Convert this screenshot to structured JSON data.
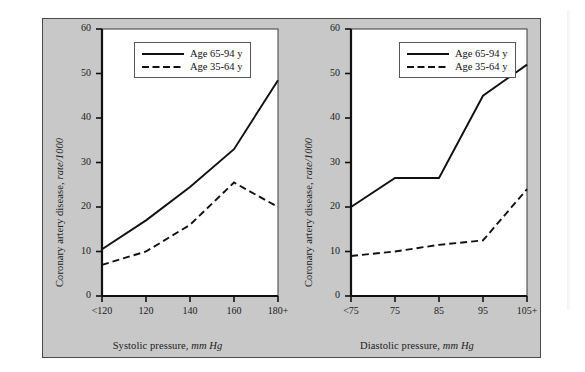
{
  "figure": {
    "background_color": "#c8c8c8",
    "frame_color": "#4a4a4a",
    "plot_background": "#ffffff"
  },
  "legend": {
    "series": [
      {
        "label": "Age 65-94 y",
        "style": "solid"
      },
      {
        "label": "Age 35-64 y",
        "style": "dashed"
      }
    ]
  },
  "chart_data": [
    {
      "type": "line",
      "panel": "left",
      "title": "",
      "xlabel_text": "Systolic pressure,",
      "xlabel_units": "mm Hg",
      "xlabel": "Systolic pressure, mm Hg",
      "ylabel_text": "Coronary artery disease,",
      "ylabel_units": "rate/1000",
      "ylabel": "Coronary artery disease, rate/1000",
      "categories": [
        "<120",
        "120",
        "140",
        "160",
        "180+"
      ],
      "xticklabels": [
        "<120",
        "120",
        "140",
        "160",
        "180+"
      ],
      "yticklabels": [
        "0",
        "10",
        "20",
        "30",
        "40",
        "50",
        "60"
      ],
      "yticks": [
        0,
        10,
        20,
        30,
        40,
        50,
        60
      ],
      "ylim": [
        0,
        60
      ],
      "grid": false,
      "legend_position": "upper-left",
      "series": [
        {
          "name": "Age 65-94 y",
          "style": "solid",
          "values": [
            10.5,
            17.0,
            24.5,
            33.0,
            48.5
          ]
        },
        {
          "name": "Age 35-64 y",
          "style": "dashed",
          "values": [
            7.0,
            10.0,
            16.0,
            25.5,
            20.0
          ]
        }
      ]
    },
    {
      "type": "line",
      "panel": "right",
      "title": "",
      "xlabel_text": "Diastolic pressure,",
      "xlabel_units": "mm Hg",
      "xlabel": "Diastolic pressure, mm Hg",
      "ylabel_text": "Coronary artery disease,",
      "ylabel_units": "rate/1000",
      "ylabel": "Coronary artery disease, rate/1000",
      "categories": [
        "<75",
        "75",
        "85",
        "95",
        "105+"
      ],
      "xticklabels": [
        "<75",
        "75",
        "85",
        "95",
        "105+"
      ],
      "yticklabels": [
        "0",
        "10",
        "20",
        "30",
        "40",
        "50",
        "60"
      ],
      "yticks": [
        0,
        10,
        20,
        30,
        40,
        50,
        60
      ],
      "ylim": [
        0,
        60
      ],
      "grid": false,
      "legend_position": "upper-left",
      "series": [
        {
          "name": "Age 65-94 y",
          "style": "solid",
          "values": [
            20.0,
            26.5,
            26.5,
            45.0,
            52.0
          ]
        },
        {
          "name": "Age 35-64 y",
          "style": "dashed",
          "values": [
            9.0,
            10.0,
            11.5,
            12.5,
            24.0
          ]
        }
      ]
    }
  ]
}
